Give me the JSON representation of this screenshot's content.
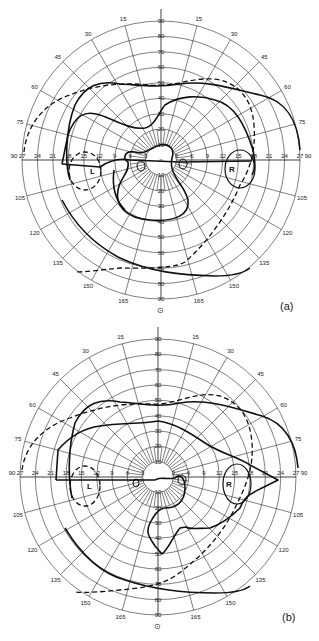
{
  "figure": {
    "type": "visual-field-perimetry-chart",
    "panels": [
      {
        "id": "a",
        "label": "(a)",
        "ring_labels": [
          "10",
          "20",
          "30",
          "40",
          "50",
          "60",
          "70",
          "80",
          "90"
        ],
        "horizontal_labels_left": [
          "90",
          "27",
          "24",
          "21",
          "18",
          "15",
          "12",
          "9",
          "6",
          "3"
        ],
        "horizontal_labels_right": [
          "3",
          "6",
          "9",
          "12",
          "15",
          "18",
          "21",
          "24",
          "27",
          "90"
        ],
        "meridian_labels_left": [
          "15",
          "30",
          "45",
          "60",
          "75",
          "105",
          "120",
          "135",
          "150",
          "165"
        ],
        "meridian_labels_right": [
          "15",
          "30",
          "45",
          "60",
          "75",
          "105",
          "120",
          "135",
          "150",
          "165"
        ],
        "fixation_symbol": "⊙",
        "center_mark": "o",
        "blind_spot_labels": {
          "left": "L",
          "right": "R"
        }
      },
      {
        "id": "b",
        "label": "(b)",
        "ring_labels": [
          "10",
          "20",
          "30",
          "40",
          "50",
          "60",
          "70",
          "80",
          "90"
        ],
        "horizontal_labels_left": [
          "90",
          "27",
          "24",
          "21",
          "18",
          "15",
          "12",
          "9",
          "6",
          "3"
        ],
        "horizontal_labels_right": [
          "3",
          "6",
          "9",
          "12",
          "15",
          "18",
          "21",
          "24",
          "27",
          "90"
        ],
        "meridian_labels_left": [
          "15",
          "30",
          "45",
          "60",
          "75",
          "105",
          "120",
          "135",
          "150",
          "165"
        ],
        "meridian_labels_right": [
          "15",
          "30",
          "45",
          "60",
          "75",
          "105",
          "120",
          "135",
          "150",
          "165"
        ],
        "fixation_symbol": "⊙",
        "blind_spot_labels": {
          "left": "L",
          "right": "R"
        }
      }
    ],
    "line_legend": {
      "solid": "solid isopter",
      "dashed": "dashed isopter"
    }
  }
}
